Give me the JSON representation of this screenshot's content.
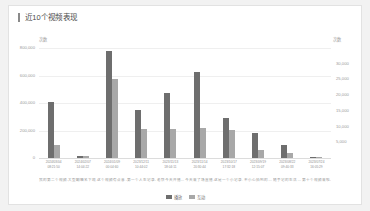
{
  "card": {
    "title": "近10个视频表现"
  },
  "legend": {
    "position": "bottom-center",
    "items": [
      {
        "label": "播放",
        "color": "#6e6e6e"
      },
      {
        "label": "互动",
        "color": "#a8a8a8"
      }
    ]
  },
  "chart_data": {
    "type": "bar",
    "title": "近10个视频表现",
    "xlabel": "",
    "ylabel": "次数",
    "grid": true,
    "legend_position": "bottom-center",
    "left_axis": {
      "unit": "次数",
      "ticks": [
        "800,000",
        "600,000",
        "400,000",
        "200,000",
        "0"
      ],
      "ylim": [
        0,
        800000
      ]
    },
    "right_axis": {
      "unit": "次数",
      "ticks": [
        "30,000",
        "25,000",
        "20,000",
        "15,000",
        "10,000",
        "5,000"
      ],
      "ylim": [
        0,
        30000
      ]
    },
    "categories": [
      "2024/03/04\n08:21:50",
      "2024/02/07\n14:04:22",
      "2024/01/09\n00:04:60",
      "2023/12/11\n10:44:02",
      "2023/11/13\n18:04:11",
      "2023/11/14\n20:30:44",
      "2023/10/17\n17:32:18",
      "2023/09/19\n12:15:07",
      "2023/08/22\n09:40:33",
      "2023/07/24\n16:05:29"
    ],
    "captions": [
      "我的第二个视频…",
      "大型翻唱名下现…",
      "这个视频有点意…",
      "第一个人生记录…",
      "老铁今天开播…",
      "今天来了场直播…",
      "这是一个小记录…",
      "不小心拍到的…",
      "随手记的生活…",
      "第十个视频来啦…"
    ],
    "series": [
      {
        "name": "播放",
        "color": "#6e6e6e",
        "values": [
          405000,
          12000,
          780000,
          350000,
          470000,
          625000,
          290000,
          185000,
          95000,
          7000
        ]
      },
      {
        "name": "互动",
        "color": "#a8a8a8",
        "values": [
          3500,
          600,
          21500,
          7800,
          8000,
          8200,
          7600,
          2300,
          1500,
          300
        ]
      }
    ]
  }
}
